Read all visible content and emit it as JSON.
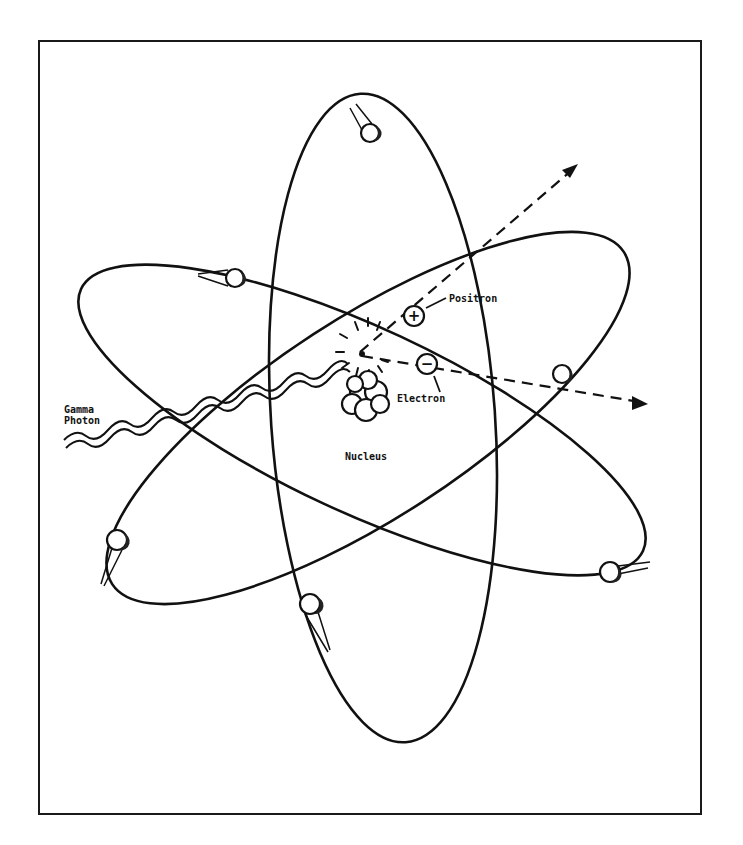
{
  "figure": {
    "labels": {
      "gamma_photon_line1": "Gamma",
      "gamma_photon_line2": "Photon",
      "positron": "Positron",
      "electron": "Electron",
      "nucleus": "Nucleus"
    },
    "symbols": {
      "positron_sign": "+",
      "electron_sign": "−"
    },
    "orbit_count": 3,
    "orbiting_electron_count": 6,
    "colors": {
      "ink": "#111111",
      "background": "#ffffff"
    }
  }
}
